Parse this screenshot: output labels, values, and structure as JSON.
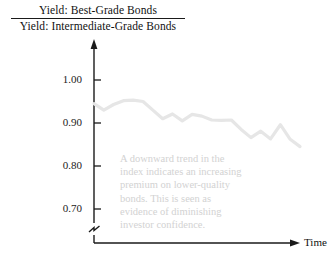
{
  "title": {
    "numerator": "Yield: Best-Grade Bonds",
    "denominator": "Yield: Intermediate-Grade Bonds"
  },
  "axes": {
    "x_label": "Time",
    "y_ticks": [
      "1.00",
      "0.90",
      "0.80",
      "0.70"
    ],
    "axis_color": "#1a1a1a",
    "has_axis_break": true
  },
  "annotation": {
    "lines": [
      "A downward trend in the",
      "index indicates an increasing",
      "premium on lower-quality",
      "bonds. This is seen as",
      "evidence of diminishing",
      "investor confidence."
    ],
    "color": "#d2d2d2"
  },
  "chart_data": {
    "type": "line",
    "xlabel": "Time",
    "ylabel": "",
    "ylim": [
      0.655,
      1.02
    ],
    "ytick_values": [
      1.0,
      0.9,
      0.8,
      0.7
    ],
    "grid": false,
    "legend": "none",
    "series_color": "#e6e6e6",
    "series": [
      {
        "name": "Yield ratio (best-grade / intermediate-grade bonds)",
        "x": [
          0,
          1,
          2,
          3,
          4,
          5,
          6,
          7,
          8,
          9,
          10,
          11,
          12,
          13,
          14,
          15,
          16,
          17,
          18,
          19,
          20,
          21
        ],
        "values": [
          0.945,
          0.93,
          0.943,
          0.952,
          0.953,
          0.95,
          0.93,
          0.91,
          0.921,
          0.905,
          0.92,
          0.916,
          0.907,
          0.906,
          0.907,
          0.885,
          0.866,
          0.881,
          0.863,
          0.896,
          0.862,
          0.845
        ]
      }
    ]
  }
}
